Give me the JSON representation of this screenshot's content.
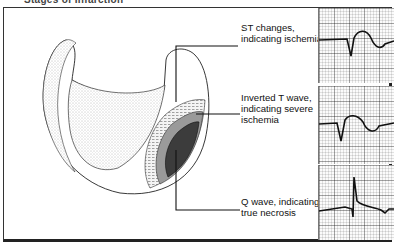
{
  "header": {
    "clipped_title": "Stages of Infarction"
  },
  "labels": [
    {
      "id": "st",
      "text": "ST changes,\nindicating ischemia"
    },
    {
      "id": "t",
      "text": "Inverted T wave,\nindicating severe\nischemia"
    },
    {
      "id": "q",
      "text": "Q wave, indicating\ntrue necrosis"
    }
  ],
  "ecg_strips": [
    {
      "id": "st",
      "pattern": "ST changes"
    },
    {
      "id": "t",
      "pattern": "Inverted T wave"
    },
    {
      "id": "q",
      "pattern": "Q wave"
    }
  ],
  "colors": {
    "line": "#111111",
    "grid": "#999999",
    "zone_outer": "#d9d9d9",
    "zone_mid": "#8a8a8a",
    "zone_inner": "#3a3a3a"
  }
}
